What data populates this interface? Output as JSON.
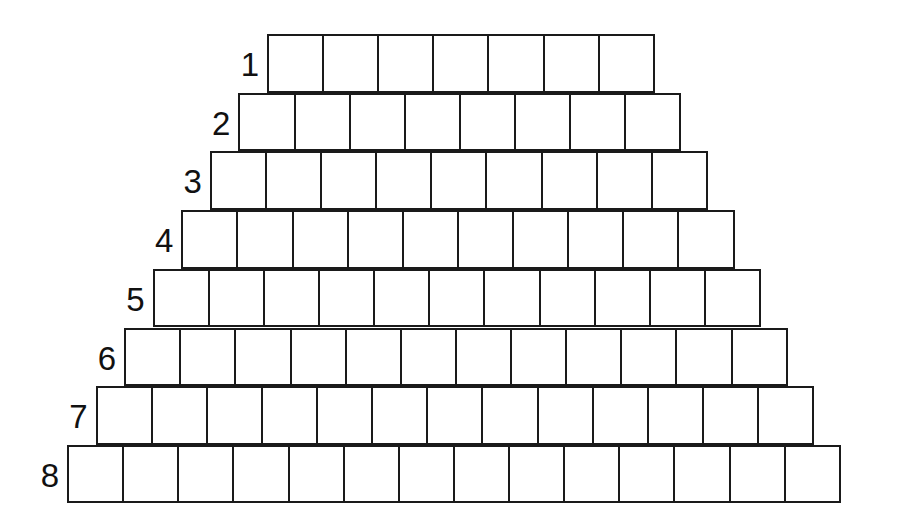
{
  "diagram": {
    "type": "staircase-grid",
    "line_color": "#1a1a1a",
    "background": "#ffffff",
    "rows": [
      {
        "label": "1",
        "cells": 7
      },
      {
        "label": "2",
        "cells": 8
      },
      {
        "label": "3",
        "cells": 9
      },
      {
        "label": "4",
        "cells": 10
      },
      {
        "label": "5",
        "cells": 11
      },
      {
        "label": "6",
        "cells": 12
      },
      {
        "label": "7",
        "cells": 13
      },
      {
        "label": "8",
        "cells": 14
      }
    ]
  }
}
